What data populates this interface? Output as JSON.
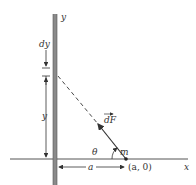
{
  "diagram": {
    "rod_axis_label": "y",
    "element_label": "dy",
    "distance_label": "y",
    "force_label": "dF",
    "angle_label": "θ",
    "mass_label": "m",
    "horizontal_distance_label": "a",
    "point_label": "(a, 0)",
    "x_axis_label": "x",
    "colors": {
      "rod": "#8a8a8a",
      "lines": "#333333",
      "background": "#ffffff"
    }
  }
}
